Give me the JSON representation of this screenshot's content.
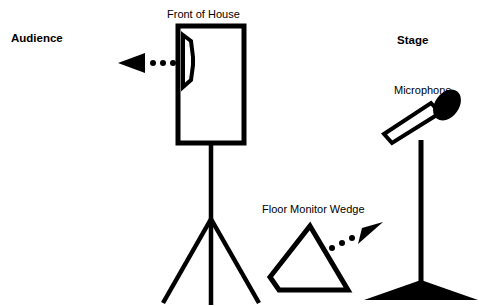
{
  "diagram": {
    "background_color": "#ffffff",
    "stroke_color": "#000000",
    "width": 479,
    "height": 306,
    "labels": {
      "audience": "Audience",
      "stage": "Stage",
      "front_of_house": "Front of House",
      "microphone": "Microphone",
      "floor_monitor_wedge": "Floor Monitor Wedge"
    },
    "elements": {
      "fbox_speaker": {
        "name": "front-of-house-speaker",
        "shape": "rectangle-with-horn",
        "fill": "#ffffff",
        "stroke": "#000000"
      },
      "speaker_stand": {
        "name": "tripod-speaker-stand",
        "shape": "tripod",
        "stroke": "#000000"
      },
      "mic": {
        "name": "microphone-capsule",
        "head_fill": "#000000",
        "body_fill": "#ffffff"
      },
      "mic_stand": {
        "name": "microphone-stand",
        "base_shape": "flat-triangle-base",
        "fill": "#000000"
      },
      "wedge": {
        "name": "floor-monitor-wedge",
        "shape": "clipped-triangle",
        "fill": "#ffffff",
        "stroke": "#000000"
      },
      "arrow_audience": {
        "name": "sound-arrow-to-audience",
        "direction": "left",
        "dot_count": 3,
        "fill": "#000000"
      },
      "arrow_wedge": {
        "name": "sound-arrow-from-wedge",
        "direction": "up-right",
        "dot_count": 3,
        "fill": "#000000"
      }
    }
  }
}
